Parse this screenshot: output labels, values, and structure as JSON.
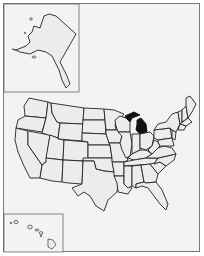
{
  "map": {
    "type": "us-states-locator",
    "highlighted_state": "Michigan",
    "colors": {
      "background": "#f3f3f3",
      "state_fill": "#ececec",
      "state_border": "#222222",
      "highlight_fill": "#111111",
      "inset_border": "#666666"
    },
    "insets": [
      "Alaska",
      "Hawaii"
    ]
  }
}
